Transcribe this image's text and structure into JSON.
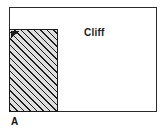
{
  "figure": {
    "panel_letter": "A",
    "frame": {
      "name": "cross-section-frame",
      "border_color": "#2b2b2b",
      "fill_color": "#ffffff"
    },
    "regions": [
      {
        "id": "cliff-mass",
        "label": "",
        "fill": "hatched",
        "hatch_color": "#1c1c1c",
        "hatch_background": "#dedede",
        "hatch_angle_deg": 45
      },
      {
        "id": "open-space",
        "label": "Cliff",
        "fill": "#ffffff"
      }
    ],
    "annotations": [
      {
        "id": "cliff-text",
        "text": "Cliff"
      },
      {
        "id": "panel-letter-text",
        "text": "A"
      }
    ]
  }
}
